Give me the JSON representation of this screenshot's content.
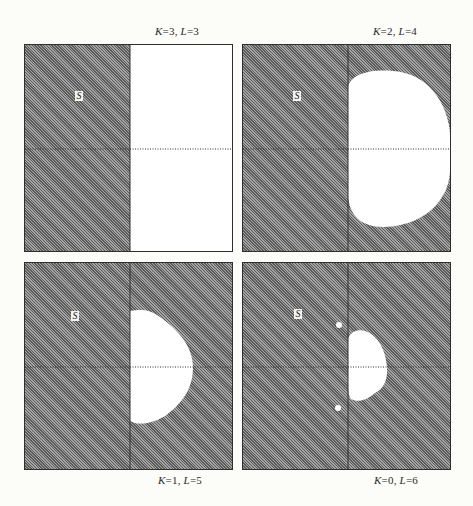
{
  "figure": {
    "colors": {
      "hatched_region": "#7a7a7a",
      "allowed_region": "#ffffff",
      "axis_line": "#2e2e2e",
      "background": "#fcfcf8"
    },
    "panels": [
      {
        "id": "k3-l3",
        "label": {
          "k_var": "K",
          "k_val": "=3, ",
          "l_var": "L",
          "l_val": "=3"
        },
        "marker": "S",
        "region": "half-plane"
      },
      {
        "id": "k2-l4",
        "label": {
          "k_var": "K",
          "k_val": "=2, ",
          "l_var": "L",
          "l_val": "=4"
        },
        "marker": "S",
        "region": "large-oval"
      },
      {
        "id": "k1-l5",
        "label": {
          "k_var": "K",
          "k_val": "=1, ",
          "l_var": "L",
          "l_val": "=5"
        },
        "marker": "S",
        "region": "semicircle"
      },
      {
        "id": "k0-l6",
        "label": {
          "k_var": "K",
          "k_val": "=0, ",
          "l_var": "L",
          "l_val": "=6"
        },
        "marker": "S",
        "region": "small-oval-with-points"
      }
    ]
  }
}
